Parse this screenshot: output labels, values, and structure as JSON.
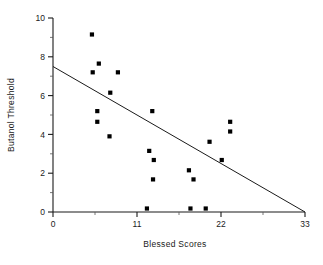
{
  "chart_data": {
    "type": "scatter",
    "title": "",
    "xlabel": "Blessed Scores",
    "ylabel": "Butanol Threshold",
    "xlim": [
      0,
      33
    ],
    "ylim": [
      0,
      10
    ],
    "x_ticks": [
      0,
      11,
      22,
      33
    ],
    "x_tick_labels": [
      "0",
      "11",
      "22",
      "33"
    ],
    "x_minor_ticks": [
      5.5,
      16.5,
      27.5
    ],
    "y_ticks": [
      0,
      2,
      4,
      6,
      8,
      10
    ],
    "y_tick_labels": [
      "0",
      "2",
      "4",
      "6",
      "8",
      "10"
    ],
    "y_minor_ticks": [
      1,
      3,
      5,
      7,
      9
    ],
    "grid": false,
    "legend": null,
    "marker_shape": "square",
    "marker_color": "#000000",
    "points": [
      {
        "x": 5.1,
        "y": 9.15
      },
      {
        "x": 6.0,
        "y": 7.65
      },
      {
        "x": 5.2,
        "y": 7.2
      },
      {
        "x": 8.5,
        "y": 7.2
      },
      {
        "x": 7.5,
        "y": 6.15
      },
      {
        "x": 5.8,
        "y": 5.2
      },
      {
        "x": 13.0,
        "y": 5.2
      },
      {
        "x": 5.8,
        "y": 4.65
      },
      {
        "x": 23.2,
        "y": 4.65
      },
      {
        "x": 23.2,
        "y": 4.15
      },
      {
        "x": 7.4,
        "y": 3.9
      },
      {
        "x": 20.5,
        "y": 3.62
      },
      {
        "x": 12.6,
        "y": 3.15
      },
      {
        "x": 13.2,
        "y": 2.68
      },
      {
        "x": 22.1,
        "y": 2.68
      },
      {
        "x": 17.8,
        "y": 2.15
      },
      {
        "x": 13.1,
        "y": 1.68
      },
      {
        "x": 18.4,
        "y": 1.68
      },
      {
        "x": 12.3,
        "y": 0.18
      },
      {
        "x": 18.0,
        "y": 0.18
      },
      {
        "x": 20.0,
        "y": 0.18
      }
    ],
    "fit_line": {
      "type": "linear",
      "x_start": 0,
      "y_start": 7.5,
      "x_end": 33,
      "y_end": 0.0
    }
  }
}
